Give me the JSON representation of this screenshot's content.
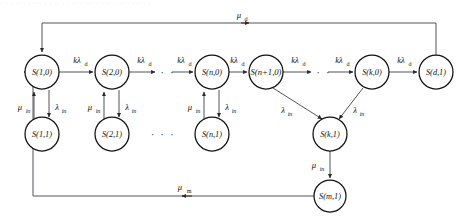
{
  "figure": {
    "title_strip": "· · ·  ·· ·  · ··· · ·  ··  · · ·· ·  ··· · · ··  · ·· · ··· · ·",
    "type": "state-transition-diagram",
    "colors": {
      "node_stroke": "#111111",
      "node_fill": "#ffffff",
      "edge_stroke": "#4a4a52",
      "text": "#111111"
    }
  },
  "nodes": {
    "top_row": [
      {
        "id": "s-1-0",
        "label": "S(1,0)",
        "base": "S",
        "args": "(1,0)",
        "x": 42,
        "y": 72,
        "r": 17
      },
      {
        "id": "s-2-0",
        "label": "S(2,0)",
        "base": "S",
        "args": "(2,0)",
        "x": 112,
        "y": 72,
        "r": 17
      },
      {
        "id": "s-n-0",
        "label": "S(n,0)",
        "base": "S",
        "args": "(n,0)",
        "x": 212,
        "y": 72,
        "r": 17
      },
      {
        "id": "s-n1-0",
        "label": "S(n+1,0)",
        "base": "S",
        "args": "(n+1,0)",
        "x": 266,
        "y": 72,
        "r": 17
      },
      {
        "id": "s-k-0",
        "label": "S(k,0)",
        "base": "S",
        "args": "(k,0)",
        "x": 372,
        "y": 72,
        "r": 17
      },
      {
        "id": "s-d-1",
        "label": "S(d,1)",
        "base": "S",
        "args": "(d,1)",
        "x": 436,
        "y": 72,
        "r": 17
      }
    ],
    "second_row": [
      {
        "id": "s-1-1",
        "label": "S(1,1)",
        "base": "S",
        "args": "(1,1)",
        "x": 42,
        "y": 134,
        "r": 17
      },
      {
        "id": "s-2-1",
        "label": "S(2,1)",
        "base": "S",
        "args": "(2,1)",
        "x": 112,
        "y": 134,
        "r": 17
      },
      {
        "id": "s-n-1",
        "label": "S(n,1)",
        "base": "S",
        "args": "(n,1)",
        "x": 212,
        "y": 134,
        "r": 17
      },
      {
        "id": "s-k-1",
        "label": "S(k,1)",
        "base": "S",
        "args": "(k,1)",
        "x": 330,
        "y": 134,
        "r": 17
      }
    ],
    "bottom_row": [
      {
        "id": "s-m-1",
        "label": "S(m,1)",
        "base": "S",
        "args": "(m,1)",
        "x": 330,
        "y": 196,
        "r": 16
      }
    ]
  },
  "ellipses": [
    {
      "id": "dots-top-1",
      "text": "· · ·",
      "x": 163,
      "y": 76
    },
    {
      "id": "dots-top-2",
      "text": "· · ·",
      "x": 319,
      "y": 76
    },
    {
      "id": "dots-second-1",
      "text": "· · ·",
      "x": 163,
      "y": 138
    }
  ],
  "edge_labels": {
    "k_lambda_d": {
      "base": "kλ",
      "sub": "d"
    },
    "lambda_in": {
      "base": "λ",
      "sub": "in"
    },
    "mu_in": {
      "base": "μ",
      "sub": "in"
    },
    "mu_d": {
      "base": "μ",
      "sub": "d"
    },
    "mu_m": {
      "base": "μ",
      "sub": "m"
    }
  },
  "edges": [
    {
      "id": "e-k1",
      "label": "k_lambda_d",
      "lx": 77,
      "ly": 60,
      "from": "s-1-0",
      "to": "s-2-0"
    },
    {
      "id": "e-k2",
      "label": "k_lambda_d",
      "lx": 147,
      "ly": 60,
      "from": "s-2-0",
      "to": "dots-top-1"
    },
    {
      "id": "e-k3",
      "label": "k_lambda_d",
      "lx": 186,
      "ly": 60,
      "from": "dots-top-1",
      "to": "s-n-0"
    },
    {
      "id": "e-k4",
      "label": "k_lambda_d",
      "lx": 240,
      "ly": 60,
      "from": "s-n-0",
      "to": "s-n1-0"
    },
    {
      "id": "e-k5",
      "label": "k_lambda_d",
      "lx": 301,
      "ly": 60,
      "from": "s-n1-0",
      "to": "dots-top-2"
    },
    {
      "id": "e-k6",
      "label": "k_lambda_d",
      "lx": 344,
      "ly": 60,
      "from": "dots-top-2",
      "to": "s-k-0"
    },
    {
      "id": "e-k7",
      "label": "k_lambda_d",
      "lx": 406,
      "ly": 60,
      "from": "s-k-0",
      "to": "s-d-1"
    },
    {
      "id": "e-mu1",
      "label": "mu_in",
      "lx": 22,
      "ly": 107,
      "from": "s-1-1",
      "to": "s-1-0"
    },
    {
      "id": "e-li1",
      "label": "lambda_in",
      "lx": 57,
      "ly": 107,
      "from": "s-1-0",
      "to": "s-1-1"
    },
    {
      "id": "e-mu2",
      "label": "mu_in",
      "lx": 92,
      "ly": 107,
      "from": "s-2-1",
      "to": "s-2-0"
    },
    {
      "id": "e-li2",
      "label": "lambda_in",
      "lx": 127,
      "ly": 107,
      "from": "s-2-0",
      "to": "s-2-1"
    },
    {
      "id": "e-mu3",
      "label": "mu_in",
      "lx": 192,
      "ly": 107,
      "from": "s-n-1",
      "to": "s-n-0"
    },
    {
      "id": "e-li3",
      "label": "lambda_in",
      "lx": 227,
      "ly": 107,
      "from": "s-n-0",
      "to": "s-n-1"
    },
    {
      "id": "e-li4",
      "label": "lambda_in",
      "lx": 286,
      "ly": 113,
      "from": "s-n1-0",
      "to": "s-k-1"
    },
    {
      "id": "e-li5",
      "label": "lambda_in",
      "lx": 355,
      "ly": 113,
      "from": "s-k-0",
      "to": "s-k-1"
    },
    {
      "id": "e-mu4",
      "label": "mu_in",
      "lx": 317,
      "ly": 167,
      "from": "s-k-1",
      "to": "s-m-1"
    },
    {
      "id": "e-mud",
      "label": "mu_d",
      "lx": 243,
      "ly": 17,
      "from": "s-d-1",
      "to": "s-1-0"
    },
    {
      "id": "e-mum",
      "label": "mu_m",
      "lx": 185,
      "ly": 186,
      "from": "s-m-1",
      "to": "s-1-0"
    }
  ]
}
